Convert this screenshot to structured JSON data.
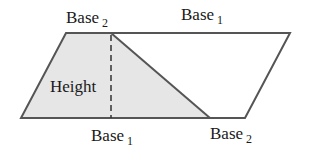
{
  "diagram": {
    "labels": {
      "top_left": {
        "text": "Base",
        "sub": "2"
      },
      "top_right": {
        "text": "Base",
        "sub": "1"
      },
      "height": "Height",
      "bottom_left": {
        "text": "Base",
        "sub": "1"
      },
      "bottom_right": {
        "text": "Base",
        "sub": "2"
      }
    },
    "colors": {
      "stroke": "#555555",
      "shaded_fill": "#e6e6e6",
      "background": "#ffffff"
    }
  }
}
